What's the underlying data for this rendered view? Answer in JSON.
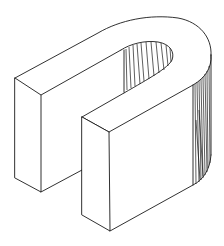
{
  "figure": {
    "subject": "isometric U-shaped block",
    "line_color": "#1a1a1a",
    "background": "#ffffff",
    "parts": [
      {
        "name": "left-arm",
        "shading": "none"
      },
      {
        "name": "right-arm",
        "shading": "none"
      },
      {
        "name": "curved-end",
        "shading": "vertical hatching"
      },
      {
        "name": "inner-slot",
        "shading": "vertical hatching"
      }
    ]
  }
}
